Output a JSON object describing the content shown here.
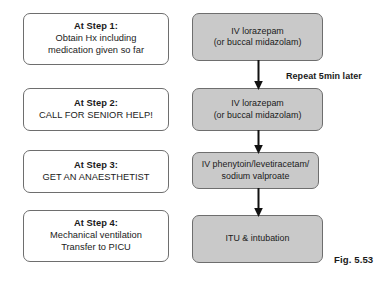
{
  "figure": {
    "caption": "Fig. 5.53",
    "annotation": "Repeat 5min later",
    "colors": {
      "box_fill_gray": "#c9c9c9",
      "box_fill_white": "#ffffff",
      "box_border": "#6e6e6e",
      "arrow": "#111111",
      "text": "#1a1a1a"
    }
  },
  "steps_column": {
    "boxes": [
      {
        "step_label": "At Step 1:",
        "line1": "Obtain Hx including",
        "line2": "medication given so far"
      },
      {
        "step_label": "At Step 2:",
        "line1": "CALL FOR SENIOR HELP!",
        "line2": ""
      },
      {
        "step_label": "At Step 3:",
        "line1": "GET AN ANAESTHETIST",
        "line2": ""
      },
      {
        "step_label": "At Step 4:",
        "line1": "Mechanical ventilation",
        "line2": "Transfer to PICU"
      }
    ]
  },
  "treatment_column": {
    "boxes": [
      {
        "line1": "IV lorazepam",
        "line2": "(or buccal midazolam)"
      },
      {
        "line1": "IV lorazepam",
        "line2": "(or buccal midazolam)"
      },
      {
        "line1": "IV phenytoin/levetiracetam/",
        "line2": "sodium valproate"
      },
      {
        "line1": "ITU & intubation",
        "line2": ""
      }
    ]
  }
}
